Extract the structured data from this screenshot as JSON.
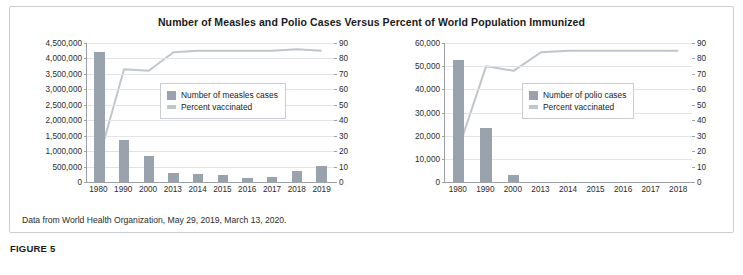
{
  "figure": {
    "title": "Number of Measles and Polio Cases Versus Percent of  World Population Immunized",
    "source": "Data from World Health Organization, May 29, 2019, March 13, 2020.",
    "caption": "FIGURE 5",
    "colors": {
      "bar": "#9aa3ad",
      "line": "#bfc6cc",
      "grid": "#e2e4e7",
      "axis": "#9aa0a6"
    }
  },
  "chart_data": [
    {
      "type": "bar",
      "id": "measles",
      "title": "",
      "xlabel": "",
      "ylabel": "",
      "categories": [
        "1980",
        "1990",
        "2000",
        "2013",
        "2014",
        "2015",
        "2016",
        "2017",
        "2018",
        "2019"
      ],
      "ylim": [
        0,
        4500000
      ],
      "yticks": [
        0,
        500000,
        1000000,
        1500000,
        2000000,
        2500000,
        3000000,
        3500000,
        4000000,
        4500000
      ],
      "ytick_labels": [
        "0",
        "500,000",
        "1,000,000",
        "1,500,000",
        "2,000,000",
        "2,500,000",
        "3,000,000",
        "3,500,000",
        "4,000,000",
        "4,500,000"
      ],
      "y2lim": [
        0,
        90
      ],
      "y2ticks": [
        0,
        10,
        20,
        30,
        40,
        50,
        60,
        70,
        80,
        90
      ],
      "y2tick_labels": [
        "0",
        "10",
        "20",
        "30",
        "40",
        "50",
        "60",
        "70",
        "80",
        "90"
      ],
      "grid": true,
      "legend_position": "upper-center",
      "series": [
        {
          "name": "Number of measles cases",
          "kind": "bar",
          "axis": "left",
          "values": [
            4211431,
            1374083,
            853479,
            278358,
            267455,
            218639,
            132490,
            173330,
            353236,
            521644
          ]
        },
        {
          "name": "Percent vaccinated",
          "kind": "line",
          "axis": "right",
          "values": [
            16,
            73,
            72,
            84,
            85,
            85,
            85,
            85,
            86,
            85
          ]
        }
      ]
    },
    {
      "type": "bar",
      "id": "polio",
      "title": "",
      "xlabel": "",
      "ylabel": "",
      "categories": [
        "1980",
        "1990",
        "2000",
        "2013",
        "2014",
        "2015",
        "2016",
        "2017",
        "2018"
      ],
      "ylim": [
        0,
        60000
      ],
      "yticks": [
        0,
        10000,
        20000,
        30000,
        40000,
        50000,
        60000
      ],
      "ytick_labels": [
        "0",
        "10,000",
        "20,000",
        "30,000",
        "40,000",
        "50,000",
        "60,000"
      ],
      "y2lim": [
        0,
        90
      ],
      "y2ticks": [
        0,
        10,
        20,
        30,
        40,
        50,
        60,
        70,
        80,
        90
      ],
      "y2tick_labels": [
        "0",
        "10",
        "20",
        "30",
        "40",
        "50",
        "60",
        "70",
        "80",
        "90"
      ],
      "grid": true,
      "legend_position": "upper-center",
      "series": [
        {
          "name": "Number of polio cases",
          "kind": "bar",
          "axis": "left",
          "values": [
            52795,
            23484,
            2979,
            0,
            0,
            0,
            0,
            0,
            0
          ]
        },
        {
          "name": "Percent vaccinated",
          "kind": "line",
          "axis": "right",
          "values": [
            22,
            75,
            72,
            84,
            85,
            85,
            85,
            85,
            85
          ]
        }
      ]
    }
  ]
}
